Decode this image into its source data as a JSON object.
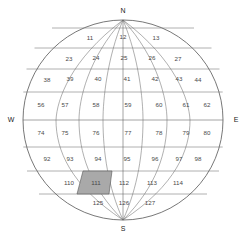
{
  "diagram": {
    "type": "globe-grid",
    "colors": {
      "grid_line": "#6e6e6e",
      "outline": "#555555",
      "highlight_fill": "#a9a9a9",
      "text": "#4a4a4a",
      "background": "#ffffff"
    },
    "sphere": {
      "center_x": 123,
      "center_y": 120,
      "radius": 100
    },
    "cardinals": {
      "north": "N",
      "south": "S",
      "east": "E",
      "west": "W"
    },
    "highlighted_cell": "111",
    "rows": [
      {
        "index": 0,
        "cells": [
          {
            "label": "11",
            "x": 90,
            "y": 38
          },
          {
            "label": "12",
            "x": 123,
            "y": 37
          },
          {
            "label": "13",
            "x": 156,
            "y": 38
          }
        ]
      },
      {
        "index": 1,
        "cells": [
          {
            "label": "23",
            "x": 69,
            "y": 59
          },
          {
            "label": "24",
            "x": 96,
            "y": 58
          },
          {
            "label": "25",
            "x": 124,
            "y": 58
          },
          {
            "label": "26",
            "x": 152,
            "y": 58
          },
          {
            "label": "27",
            "x": 178,
            "y": 59
          }
        ]
      },
      {
        "index": 2,
        "cells": [
          {
            "label": "38",
            "x": 47,
            "y": 80
          },
          {
            "label": "39",
            "x": 70,
            "y": 79
          },
          {
            "label": "40",
            "x": 98,
            "y": 79
          },
          {
            "label": "41",
            "x": 127,
            "y": 79
          },
          {
            "label": "42",
            "x": 155,
            "y": 79
          },
          {
            "label": "43",
            "x": 179,
            "y": 79
          },
          {
            "label": "44",
            "x": 198,
            "y": 80
          }
        ]
      },
      {
        "index": 3,
        "cells": [
          {
            "label": "56",
            "x": 41,
            "y": 105
          },
          {
            "label": "57",
            "x": 65,
            "y": 105
          },
          {
            "label": "58",
            "x": 96,
            "y": 105
          },
          {
            "label": "59",
            "x": 128,
            "y": 105
          },
          {
            "label": "60",
            "x": 159,
            "y": 105
          },
          {
            "label": "61",
            "x": 186,
            "y": 105
          },
          {
            "label": "62",
            "x": 207,
            "y": 105
          }
        ]
      },
      {
        "index": 4,
        "cells": [
          {
            "label": "74",
            "x": 41,
            "y": 133
          },
          {
            "label": "75",
            "x": 65,
            "y": 133
          },
          {
            "label": "76",
            "x": 96,
            "y": 133
          },
          {
            "label": "77",
            "x": 128,
            "y": 133
          },
          {
            "label": "78",
            "x": 159,
            "y": 133
          },
          {
            "label": "79",
            "x": 186,
            "y": 133
          },
          {
            "label": "80",
            "x": 207,
            "y": 133
          }
        ]
      },
      {
        "index": 5,
        "cells": [
          {
            "label": "92",
            "x": 47,
            "y": 159
          },
          {
            "label": "93",
            "x": 70,
            "y": 159
          },
          {
            "label": "94",
            "x": 98,
            "y": 159
          },
          {
            "label": "95",
            "x": 127,
            "y": 159
          },
          {
            "label": "96",
            "x": 155,
            "y": 159
          },
          {
            "label": "97",
            "x": 179,
            "y": 159
          },
          {
            "label": "98",
            "x": 198,
            "y": 159
          }
        ]
      },
      {
        "index": 6,
        "cells": [
          {
            "label": "110",
            "x": 69,
            "y": 183
          },
          {
            "label": "111",
            "x": 96,
            "y": 183
          },
          {
            "label": "112",
            "x": 124,
            "y": 183
          },
          {
            "label": "113",
            "x": 152,
            "y": 183
          },
          {
            "label": "114",
            "x": 178,
            "y": 183
          }
        ]
      },
      {
        "index": 7,
        "cells": [
          {
            "label": "125",
            "x": 98,
            "y": 203
          },
          {
            "label": "126",
            "x": 124,
            "y": 203
          },
          {
            "label": "127",
            "x": 150,
            "y": 203
          }
        ]
      }
    ]
  }
}
